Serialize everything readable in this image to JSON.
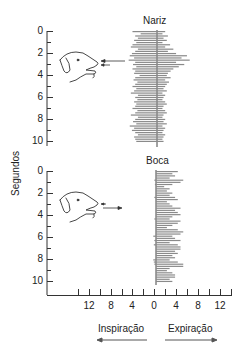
{
  "chart_data": [
    {
      "type": "bar",
      "orientation": "horizontal",
      "title": "Nariz",
      "ylabel": "Segundos",
      "xlabel_left": "Inspiração",
      "xlabel_right": "Expiração",
      "yticks": [
        "0",
        "2",
        "4",
        "6",
        "8",
        "10"
      ],
      "xticks": [
        "12",
        "8",
        "4",
        "0",
        "4",
        "8",
        "12"
      ],
      "ylim": [
        0,
        10
      ],
      "xlim": [
        -14,
        14
      ],
      "inspiration_values": [
        4.5,
        3.0,
        4.0,
        3.5,
        4.2,
        3.8,
        4.5,
        4.8,
        3.5,
        4.0,
        4.6,
        5.0,
        4.2,
        5.2,
        4.0,
        4.4,
        3.8,
        4.5,
        4.0,
        4.2,
        3.2,
        4.0,
        4.3,
        3.6,
        4.0,
        4.5,
        3.8,
        4.2,
        4.8,
        3.5,
        4.0,
        3.6,
        4.2,
        3.8,
        4.0,
        4.5,
        3.6,
        4.0,
        4.8,
        3.5,
        4.0,
        4.4,
        3.8,
        5.0,
        4.2,
        4.6,
        4.0,
        3.5,
        4.2,
        4.0,
        3.8
      ],
      "expiration_values": [
        1.5,
        1.0,
        2.0,
        1.2,
        1.8,
        1.0,
        2.4,
        1.5,
        3.0,
        2.0,
        3.5,
        5.5,
        4.5,
        6.0,
        3.5,
        5.0,
        4.0,
        3.0,
        2.5,
        2.0,
        1.8,
        2.5,
        1.5,
        2.2,
        1.8,
        1.5,
        1.2,
        1.8,
        1.0,
        1.5,
        1.2,
        1.0,
        1.5,
        1.8,
        1.2,
        1.0,
        1.5,
        1.8,
        1.2,
        1.0,
        1.5,
        1.2,
        1.8,
        1.0,
        1.5,
        1.2,
        1.0,
        1.5,
        1.2,
        1.0,
        1.2
      ]
    },
    {
      "type": "bar",
      "orientation": "horizontal",
      "title": "Boca",
      "ylabel": "Segundos",
      "xlabel_left": "Inspiração",
      "xlabel_right": "Expiração",
      "yticks": [
        "0",
        "2",
        "4",
        "6",
        "8",
        "10"
      ],
      "xticks": [
        "12",
        "8",
        "4",
        "0",
        "4",
        "8",
        "12"
      ],
      "ylim": [
        0,
        10
      ],
      "xlim": [
        -14,
        14
      ],
      "inspiration_values": [
        0,
        0,
        0,
        0,
        0.3,
        0,
        0.2,
        0,
        0,
        0,
        0,
        0,
        0.3,
        0,
        0,
        0,
        0,
        0,
        0,
        0,
        0,
        0,
        0.3,
        0,
        0,
        0,
        0,
        0,
        0,
        0,
        0.5,
        0,
        0.3,
        0,
        0.4,
        0,
        0,
        0,
        0,
        0,
        0,
        0.5,
        0.4,
        0.3,
        0,
        0,
        0,
        0,
        0,
        0
      ],
      "expiration_values": [
        4.0,
        3.0,
        3.5,
        2.5,
        5.0,
        4.5,
        3.0,
        1.5,
        2.5,
        2.0,
        3.0,
        2.5,
        3.5,
        4.0,
        2.0,
        2.5,
        3.0,
        4.5,
        3.5,
        4.0,
        4.5,
        3.0,
        2.5,
        4.5,
        4.0,
        3.0,
        2.0,
        4.0,
        5.0,
        4.5,
        3.0,
        3.5,
        4.5,
        2.5,
        4.0,
        4.5,
        4.5,
        3.5,
        4.0,
        3.0,
        3.5,
        2.5,
        4.0,
        5.0,
        5.0,
        2.5,
        2.0,
        3.0,
        3.5,
        3.5,
        2.5,
        3.0
      ]
    }
  ],
  "top_panel": {
    "title": "Nariz"
  },
  "bottom_panel": {
    "title": "Boca"
  },
  "axes": {
    "ylabel": "Segundos",
    "yticks": [
      "0",
      "2",
      "4",
      "6",
      "8",
      "10"
    ],
    "xticks": [
      "12",
      "8",
      "4",
      "0",
      "4",
      "8",
      "12"
    ],
    "left_label": "Inspiração",
    "right_label": "Expiração"
  },
  "colors": {
    "bar": "#8a8a8a",
    "axis": "#333333",
    "text": "#222222"
  }
}
